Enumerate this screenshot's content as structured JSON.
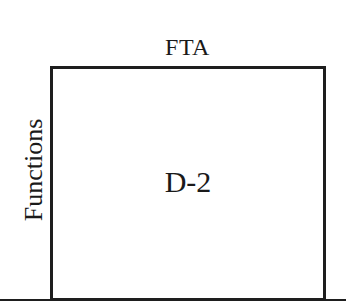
{
  "diagram": {
    "top_label": "FTA",
    "side_label": "Functions",
    "box_label": "D-2",
    "colors": {
      "stroke": "#1e1e1e",
      "background": "#ffffff",
      "text": "#1a1a1a"
    }
  }
}
